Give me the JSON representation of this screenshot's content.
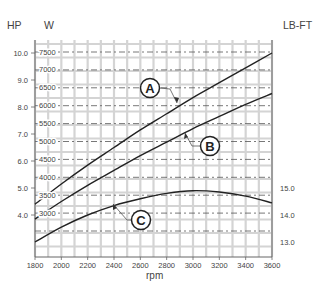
{
  "chart_data": {
    "type": "line",
    "title": "",
    "xlabel": "rpm",
    "ylabel_left_hp": "HP",
    "ylabel_left_w": "W",
    "ylabel_right": "LB-FT",
    "x_ticks": [
      1800,
      2000,
      2200,
      2400,
      2600,
      2800,
      3000,
      3200,
      3400,
      3600
    ],
    "x_tick_labels": [
      "1800",
      "2000",
      "2200",
      "2400",
      "2600",
      "2800",
      "3000",
      "3200",
      "3400",
      "3600"
    ],
    "xlim": [
      1800,
      3600
    ],
    "hp_ticks": [
      "10.0",
      "9.0",
      "8.0",
      "7.0",
      "6.0",
      "5.0",
      "4.0"
    ],
    "w_ticks": [
      "7500",
      "7000",
      "6500",
      "6000",
      "5500",
      "5000",
      "4500",
      "4000",
      "3500",
      "3000"
    ],
    "lbft_ticks": [
      "15.0",
      "14.0",
      "13.0"
    ],
    "grid": true,
    "x": [
      1800,
      2000,
      2200,
      2400,
      2600,
      2800,
      3000,
      3200,
      3400,
      3600
    ],
    "series": [
      {
        "name": "A",
        "axis": "HP",
        "values": [
          4.4,
          5.15,
          5.85,
          6.5,
          7.15,
          7.75,
          8.35,
          8.9,
          9.45,
          10.0
        ]
      },
      {
        "name": "B",
        "axis": "HP",
        "values": [
          3.85,
          4.5,
          5.1,
          5.65,
          6.2,
          6.7,
          7.2,
          7.65,
          8.1,
          8.5
        ]
      },
      {
        "name": "C",
        "axis": "LB-FT",
        "values": [
          13.0,
          13.55,
          14.0,
          14.35,
          14.6,
          14.8,
          14.9,
          14.85,
          14.7,
          14.45
        ]
      }
    ],
    "annotations": [
      {
        "label": "A",
        "target_series": "A"
      },
      {
        "label": "B",
        "target_series": "B"
      },
      {
        "label": "C",
        "target_series": "C"
      }
    ]
  },
  "labels": {
    "hp": "HP",
    "w": "W",
    "lbft": "LB-FT",
    "rpm": "rpm",
    "callout_a": "A",
    "callout_b": "B",
    "callout_c": "C"
  }
}
